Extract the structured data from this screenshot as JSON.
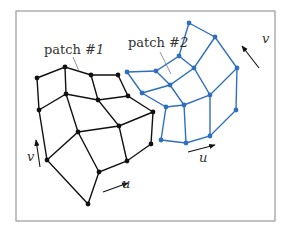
{
  "frame": {
    "x": 16,
    "y": 11,
    "w": 259,
    "h": 210,
    "stroke": "#9a9a9a"
  },
  "colors": {
    "patch1": "#111111",
    "patch2": "#2f6fc0",
    "leader": "#888888",
    "text": "#333333"
  },
  "labels": {
    "patch1": {
      "text_prefix": "patch #",
      "number": "1",
      "x": 44,
      "y": 54
    },
    "patch2": {
      "text_prefix": "patch #",
      "number": "2",
      "x": 128,
      "y": 47
    },
    "u1": {
      "text": "u",
      "x": 122,
      "y": 188
    },
    "v1": {
      "text": "v",
      "x": 27,
      "y": 161
    },
    "u2": {
      "text": "u",
      "x": 199,
      "y": 162
    },
    "v2": {
      "text": "v",
      "x": 262,
      "y": 43
    }
  },
  "patch1": {
    "grid": [
      [
        [
          37,
          78
        ],
        [
          65,
          67
        ],
        [
          91,
          75
        ],
        [
          118,
          75
        ]
      ],
      [
        [
          39,
          110
        ],
        [
          66,
          94
        ],
        [
          98,
          100
        ],
        [
          128,
          96
        ]
      ],
      [
        [
          47,
          160
        ],
        [
          78,
          132
        ],
        [
          119,
          126
        ],
        [
          153,
          112
        ]
      ],
      [
        [
          88,
          204
        ],
        [
          99,
          172
        ],
        [
          127,
          161
        ],
        [
          151,
          144
        ]
      ]
    ]
  },
  "patch2": {
    "grid": [
      [
        [
          127,
          72
        ],
        [
          156,
          71
        ],
        [
          179,
          56
        ],
        [
          189,
          23
        ]
      ],
      [
        [
          142,
          93
        ],
        [
          170,
          85
        ],
        [
          194,
          68
        ],
        [
          215,
          37
        ]
      ],
      [
        [
          166,
          107
        ],
        [
          184,
          105
        ],
        [
          210,
          95
        ],
        [
          237,
          68
        ]
      ],
      [
        [
          161,
          140
        ],
        [
          186,
          143
        ],
        [
          210,
          136
        ],
        [
          236,
          110
        ]
      ]
    ]
  },
  "arrows": {
    "u1": {
      "from": [
        103,
        192
      ],
      "to": [
        128,
        183
      ]
    },
    "v1": {
      "from": [
        40,
        167
      ],
      "to": [
        36,
        140
      ]
    },
    "u2": {
      "from": [
        188,
        152
      ],
      "to": [
        215,
        145
      ]
    },
    "v2": {
      "from": [
        259,
        68
      ],
      "to": [
        242,
        46
      ]
    }
  },
  "leaders": {
    "patch1": {
      "from": [
        73,
        57
      ],
      "to": [
        79,
        71
      ]
    },
    "patch2": {
      "from": [
        160,
        52
      ],
      "to": [
        171,
        74
      ]
    }
  }
}
